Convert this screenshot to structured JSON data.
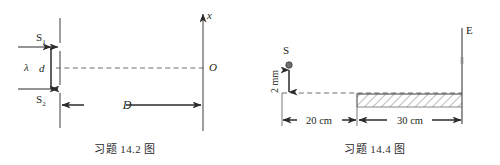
{
  "page": {
    "background_color": "#ffffff",
    "ink_color": "#231f20",
    "line_color": "#4d4d4d"
  },
  "figures": [
    {
      "id": "fig-14-2",
      "caption": "习题 14.2 图",
      "description": "double-slit interference geometry",
      "labels": {
        "slit_top": "S",
        "slit_top_sub": "1",
        "slit_bottom": "S",
        "slit_bottom_sub": "2",
        "wavelength": "λ",
        "slit_separation": "d",
        "slit_to_screen": "D",
        "origin": "O",
        "axis": "x"
      },
      "geometry": {
        "slit_plane_x": 60,
        "screen_x": 203,
        "axis_center_y": 68,
        "slit_top_y": 47,
        "slit_bottom_y": 89,
        "plane_top_y": 18,
        "plane_bottom_y": 128,
        "screen_top_y": 12,
        "screen_bottom_y": 131,
        "dimension_y": 105
      }
    },
    {
      "id": "fig-14-4",
      "caption": "习题 14.4 图",
      "description": "source above reflecting surface with screen E (Lloyd's mirror)",
      "labels": {
        "source": "S",
        "source_height": "2 mm",
        "screen": "E",
        "segment_left": "20 cm",
        "segment_right": "30 cm"
      },
      "geometry": {
        "baseline_y": 93,
        "baseline_x_start": 32,
        "baseline_x_end": 212,
        "mirror_x_start": 107,
        "mirror_x_end": 212,
        "mirror_height": 13,
        "source_x": 39,
        "source_y": 65,
        "source_radius": 3,
        "screen_x": 212,
        "screen_top_y": 28,
        "screen_bottom_y": 124,
        "dimension_y": 120
      }
    }
  ]
}
